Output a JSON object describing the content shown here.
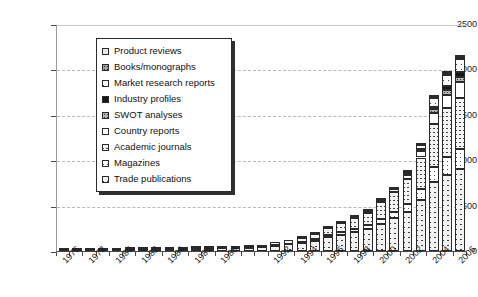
{
  "chart_data": {
    "type": "bar",
    "subtype": "stacked-bar",
    "title": "",
    "xlabel": "",
    "ylabel": "",
    "ylim": [
      0,
      2500
    ],
    "ytick_values": [
      0,
      500,
      1000,
      1500,
      2000,
      2500
    ],
    "ytick_labels": [
      "0",
      "500",
      "1000",
      "1500",
      "2000",
      "2500"
    ],
    "grid": true,
    "grid_style": "dashed-horizontal",
    "legend_position": "upper-left-inset",
    "x": [
      1976,
      1977,
      1978,
      1979,
      1980,
      1981,
      1982,
      1983,
      1984,
      1985,
      1986,
      1987,
      1988,
      1989,
      1990,
      1991,
      1992,
      1993,
      1994,
      1995,
      1996,
      1997,
      1998,
      1999,
      2000,
      2001,
      2002,
      2003,
      2004,
      2005,
      2006
    ],
    "categories": [
      "1976",
      "1977",
      "1978",
      "1979",
      "1980",
      "1981",
      "1982",
      "1983",
      "1984",
      "1985",
      "1986",
      "1987",
      "1988",
      "1989",
      "1990",
      "1991",
      "1992",
      "1993",
      "1994",
      "1995",
      "1996",
      "1997",
      "1998",
      "1999",
      "2000",
      "2001",
      "2002",
      "2003",
      "2004",
      "2005",
      "2006"
    ],
    "xtick_labels_shown": [
      "1976",
      "1978",
      "1980",
      "1982",
      "1984",
      "1986",
      "1988",
      "1992",
      "1994",
      "1996",
      "1998",
      "2000",
      "2002",
      "2004",
      "2006"
    ],
    "series": [
      {
        "name": "Trade publications",
        "pattern": "crosshatch-diagonal",
        "values": [
          8,
          10,
          10,
          11,
          14,
          16,
          18,
          20,
          24,
          24,
          26,
          26,
          28,
          30,
          36,
          42,
          60,
          72,
          86,
          110,
          150,
          176,
          206,
          240,
          300,
          360,
          430,
          560,
          760,
          840,
          900
        ]
      },
      {
        "name": "Magazines",
        "pattern": "light-diagonal-sparse",
        "values": [
          0,
          0,
          0,
          0,
          1,
          1,
          1,
          2,
          2,
          2,
          2,
          2,
          3,
          3,
          4,
          5,
          8,
          10,
          14,
          18,
          24,
          30,
          36,
          44,
          56,
          70,
          90,
          120,
          170,
          200,
          220
        ]
      },
      {
        "name": "Academic journals",
        "pattern": "fine-crosshatch",
        "values": [
          2,
          2,
          3,
          3,
          4,
          5,
          6,
          7,
          8,
          9,
          10,
          11,
          13,
          15,
          18,
          22,
          30,
          38,
          48,
          62,
          84,
          100,
          120,
          140,
          180,
          220,
          270,
          350,
          470,
          530,
          570
        ]
      },
      {
        "name": "Country reports",
        "pattern": "solid-white",
        "values": [
          0,
          0,
          0,
          0,
          0,
          0,
          0,
          0,
          0,
          0,
          0,
          0,
          0,
          0,
          0,
          0,
          0,
          0,
          2,
          4,
          6,
          8,
          12,
          16,
          24,
          34,
          48,
          74,
          120,
          150,
          170
        ]
      },
      {
        "name": "SWOT analyses",
        "pattern": "gray-dotted",
        "values": [
          0,
          0,
          0,
          0,
          0,
          0,
          0,
          0,
          0,
          0,
          0,
          0,
          0,
          0,
          0,
          0,
          0,
          0,
          0,
          0,
          0,
          0,
          0,
          0,
          2,
          4,
          8,
          16,
          40,
          54,
          60
        ]
      },
      {
        "name": "Industry profiles",
        "pattern": "solid-black",
        "values": [
          0,
          0,
          0,
          0,
          0,
          0,
          0,
          0,
          0,
          0,
          0,
          0,
          0,
          0,
          0,
          0,
          0,
          0,
          0,
          0,
          0,
          0,
          0,
          0,
          0,
          0,
          2,
          6,
          30,
          46,
          52
        ]
      },
      {
        "name": "Market research reports",
        "pattern": "bold-diagonal",
        "values": [
          0,
          0,
          0,
          0,
          0,
          0,
          0,
          0,
          0,
          0,
          0,
          0,
          0,
          0,
          0,
          0,
          0,
          0,
          0,
          0,
          0,
          0,
          2,
          4,
          8,
          14,
          22,
          40,
          90,
          120,
          140
        ]
      },
      {
        "name": "Books/monographs",
        "pattern": "dark-gray-dotted",
        "values": [
          0,
          0,
          0,
          0,
          0,
          0,
          0,
          0,
          0,
          0,
          0,
          0,
          0,
          0,
          0,
          0,
          0,
          0,
          0,
          0,
          0,
          0,
          0,
          0,
          0,
          0,
          2,
          4,
          16,
          24,
          28
        ]
      },
      {
        "name": "Product reviews",
        "pattern": "light-dotted",
        "values": [
          0,
          0,
          0,
          0,
          0,
          0,
          0,
          0,
          0,
          0,
          0,
          0,
          0,
          0,
          0,
          0,
          0,
          0,
          0,
          0,
          0,
          0,
          0,
          0,
          0,
          0,
          0,
          2,
          8,
          12,
          14
        ]
      }
    ],
    "totals": [
      10,
      12,
      13,
      14,
      19,
      22,
      25,
      29,
      34,
      35,
      38,
      39,
      44,
      48,
      58,
      69,
      98,
      120,
      150,
      194,
      264,
      314,
      376,
      444,
      570,
      702,
      872,
      1172,
      1704,
      1976,
      2154
    ],
    "legend_entries": [
      {
        "label": "Product reviews",
        "swatch": "light-dotted"
      },
      {
        "label": "Books/monographs",
        "swatch": "dark-gray-dotted"
      },
      {
        "label": "Market research reports",
        "swatch": "bold-diagonal"
      },
      {
        "label": "Industry profiles",
        "swatch": "solid-black"
      },
      {
        "label": "SWOT analyses",
        "swatch": "gray-dotted"
      },
      {
        "label": "Country reports",
        "swatch": "solid-white"
      },
      {
        "label": "Academic journals",
        "swatch": "fine-crosshatch"
      },
      {
        "label": "Magazines",
        "swatch": "light-diagonal-sparse"
      },
      {
        "label": "Trade publications",
        "swatch": "crosshatch-diagonal"
      }
    ]
  },
  "colors": {
    "axis": "#4a4a4a",
    "gridline": "#b9b9b9",
    "text": "#1b1b1b",
    "legend_border": "#2a2a2a",
    "legend_shadow": "#2f2f2f",
    "background": "#ffffff"
  }
}
